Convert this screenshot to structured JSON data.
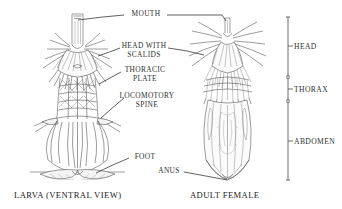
{
  "figure": {
    "background": "#ffffff",
    "ink_color": "#3a3a3a",
    "leader_color": "#1d1d1d"
  },
  "labels": {
    "mouth": "MOUTH",
    "head_with_scalids": "HEAD WITH\nSCALIDS",
    "thoracic_plate": "THORACIC\nPLATE",
    "locomotory_spine": "LOCOMOTORY\nSPINE",
    "foot": "FOOT",
    "anus": "ANUS"
  },
  "captions": {
    "left": "LARVA (VENTRAL VIEW)",
    "right": "ADULT FEMALE"
  },
  "brackets": [
    {
      "label": "HEAD",
      "top": 17,
      "bottom": 76
    },
    {
      "label": "THORAX",
      "top": 78,
      "bottom": 100
    },
    {
      "label": "ABDOMEN",
      "top": 102,
      "bottom": 180
    }
  ],
  "specimens": [
    {
      "name": "larva",
      "view": "ventral"
    },
    {
      "name": "adult-female",
      "view": "ventral"
    }
  ]
}
